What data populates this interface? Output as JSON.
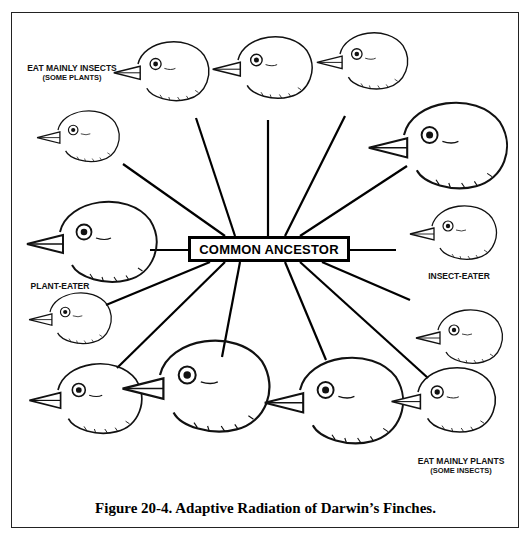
{
  "diagram": {
    "center": "COMMON ANCESTOR",
    "groups": [
      {
        "main": "EAT MAINLY INSECTS",
        "sub": "(SOME PLANTS)"
      },
      {
        "main": "PLANT-EATER",
        "sub": ""
      },
      {
        "main": "INSECT-EATER",
        "sub": ""
      },
      {
        "main": "EAT MAINLY PLANTS",
        "sub": "(SOME INSECTS)"
      }
    ],
    "finches": [
      "top-left-1",
      "top-left-2",
      "top-center",
      "top-right-1",
      "top-right-2",
      "left-middle",
      "right-middle",
      "left-lower",
      "right-lower",
      "bottom-1",
      "bottom-2",
      "bottom-3",
      "bottom-4"
    ]
  },
  "caption": "Figure 20-4.  Adaptive Radiation of Darwin’s Finches."
}
